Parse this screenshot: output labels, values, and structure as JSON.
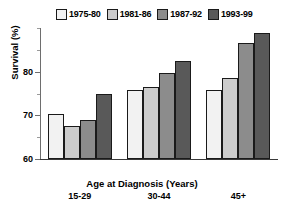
{
  "chart_data": {
    "type": "bar",
    "title": "",
    "xlabel": "Age at Diagnosis (Years)",
    "ylabel": "Survival (%)",
    "categories": [
      "15-29",
      "30-44",
      "45+"
    ],
    "ylim": [
      60,
      90
    ],
    "yticks": [
      60,
      70,
      80
    ],
    "ytick_labels": [
      "60",
      "70",
      "80"
    ],
    "yminor_step": 5,
    "grid": false,
    "legend_position": "top",
    "series": [
      {
        "name": "1975-80",
        "color": "#f2f2f2",
        "values": [
          70.2,
          75.7,
          75.7
        ]
      },
      {
        "name": "1981-86",
        "color": "#cccccc",
        "values": [
          67.5,
          76.6,
          78.6
        ]
      },
      {
        "name": "1987-92",
        "color": "#8c8c8c",
        "values": [
          69.0,
          79.8,
          86.6
        ]
      },
      {
        "name": "1993-99",
        "color": "#595959",
        "values": [
          74.8,
          82.5,
          88.9
        ]
      }
    ]
  },
  "legend": {
    "entries": [
      {
        "label": "1975-80"
      },
      {
        "label": "1981-86"
      },
      {
        "label": "1987-92"
      },
      {
        "label": "1993-99"
      }
    ]
  },
  "axes": {
    "y_title": "Survival (%)",
    "x_title": "Age at Diagnosis (Years)",
    "y_tick_0": "60",
    "y_tick_1": "70",
    "y_tick_2": "80",
    "x_cat_0": "15-29",
    "x_cat_1": "30-44",
    "x_cat_2": "45+"
  }
}
